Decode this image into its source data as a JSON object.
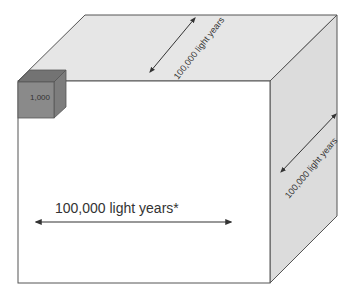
{
  "diagram": {
    "type": "cube-scale-illustration",
    "colors": {
      "face_front": "#ffffff",
      "face_top": "#e6e6e6",
      "face_right": "#dcdcdc",
      "edge": "#555555",
      "small_cube_front": "#8a8a8a",
      "small_cube_top": "#737373",
      "small_cube_side": "#7d7d7d",
      "arrow": "#333333"
    },
    "large_cube": {
      "front_label": "100,000 light years*",
      "top_depth_label": "100,000 light years",
      "right_height_label": "100,000 light years"
    },
    "small_cube": {
      "label": "1,000"
    }
  }
}
